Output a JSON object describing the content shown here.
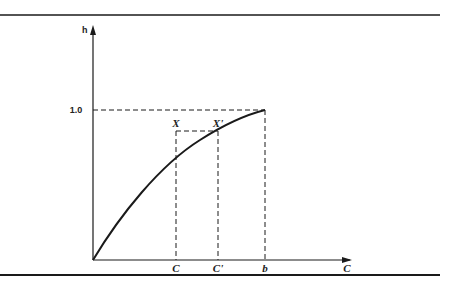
{
  "diagram": {
    "y_axis_label": "h",
    "x_axis_label": "C",
    "y_tick_label": "1.0",
    "x_ticks": [
      {
        "label": "C",
        "x": 176
      },
      {
        "label": "C'",
        "x": 218
      },
      {
        "label": "b",
        "x": 265
      }
    ],
    "points": [
      {
        "label": "X",
        "x": 176,
        "y": 131
      },
      {
        "label": "X'",
        "x": 218,
        "y": 131
      }
    ],
    "curve": "concave increasing curve from origin to (b, 1.0)",
    "colors": {
      "ink": "#1a1a1a",
      "background": "#ffffff"
    }
  }
}
